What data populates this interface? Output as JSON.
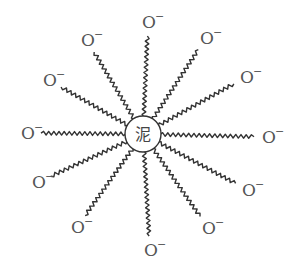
{
  "diagram": {
    "type": "micelle-structure",
    "core": {
      "label": "泥",
      "cx": 143,
      "cy": 134,
      "r": 18
    },
    "colors": {
      "stroke": "#333333",
      "text": "#555555",
      "background": "#ffffff"
    },
    "ion_label": "O",
    "ion_charge": "−",
    "tails": [
      {
        "id": "top",
        "x": 148,
        "y": 22
      },
      {
        "id": "upper-right-1",
        "x": 206,
        "y": 38
      },
      {
        "id": "upper-right-2",
        "x": 246,
        "y": 77
      },
      {
        "id": "right",
        "x": 268,
        "y": 137
      },
      {
        "id": "lower-right-1",
        "x": 248,
        "y": 190
      },
      {
        "id": "lower-right-2",
        "x": 208,
        "y": 228
      },
      {
        "id": "bottom",
        "x": 150,
        "y": 250
      },
      {
        "id": "lower-left-2",
        "x": 77,
        "y": 227
      },
      {
        "id": "lower-left-1",
        "x": 38,
        "y": 182
      },
      {
        "id": "left",
        "x": 27,
        "y": 133
      },
      {
        "id": "upper-left-2",
        "x": 49,
        "y": 80
      },
      {
        "id": "upper-left-1",
        "x": 87,
        "y": 40
      }
    ]
  }
}
